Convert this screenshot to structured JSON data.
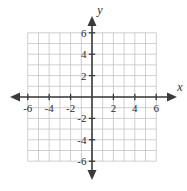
{
  "figure": {
    "kind": "cartesian-coordinate-plane",
    "background_color": "#ffffff",
    "width": 187,
    "height": 191
  },
  "axes": {
    "x_axis_label": "x",
    "y_axis_label": "y",
    "axis_color": "#3a3a3a",
    "grid_color": "#c9c9c9"
  },
  "chart_data": {
    "type": "scatter",
    "title": "",
    "xlabel": "x",
    "ylabel": "y",
    "xlim": [
      -6,
      6
    ],
    "ylim": [
      -6,
      6
    ],
    "grid": true,
    "grid_step": 1,
    "tick_step": 2,
    "legend": null,
    "x_tick_labels": [
      "-6",
      "-4",
      "-2",
      "2",
      "4",
      "6"
    ],
    "x_tick_values": [
      -6,
      -4,
      -2,
      2,
      4,
      6
    ],
    "y_tick_labels": [
      "6",
      "4",
      "2",
      "-2",
      "-4",
      "-6"
    ],
    "y_tick_values": [
      6,
      4,
      2,
      -2,
      -4,
      -6
    ],
    "series": [],
    "x": [],
    "values": [],
    "annotations": []
  }
}
